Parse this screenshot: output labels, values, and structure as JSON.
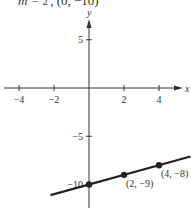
{
  "header": {
    "slope_label": "m =",
    "slope_num": "1",
    "slope_den": "2",
    "point_text": ", (0, −10)"
  },
  "chart_data": {
    "type": "line",
    "xlabel": "x",
    "ylabel": "y",
    "x_ticks": [
      -4,
      -2,
      2,
      4
    ],
    "x_tick_labels": [
      "−4",
      "−2",
      "2",
      "4"
    ],
    "y_ticks": [
      5,
      -5,
      -10
    ],
    "y_tick_labels": [
      "5",
      "−5",
      "−10"
    ],
    "xlim": [
      -5,
      5.5
    ],
    "ylim": [
      -11,
      7
    ],
    "grid": false,
    "series": [
      {
        "name": "y = (1/2)x − 10",
        "slope": 0.5,
        "intercept": -10,
        "x": [
          -2.2,
          5.8
        ],
        "y": [
          -11.1,
          -7.1
        ]
      }
    ],
    "points": [
      {
        "x": 0,
        "y": -10,
        "label": ""
      },
      {
        "x": 2,
        "y": -9,
        "label": "(2, −9)"
      },
      {
        "x": 4,
        "y": -8,
        "label": "(4, −8)"
      }
    ],
    "colors": {
      "axis": "#333333",
      "line": "#222222",
      "point": "#222222"
    }
  }
}
